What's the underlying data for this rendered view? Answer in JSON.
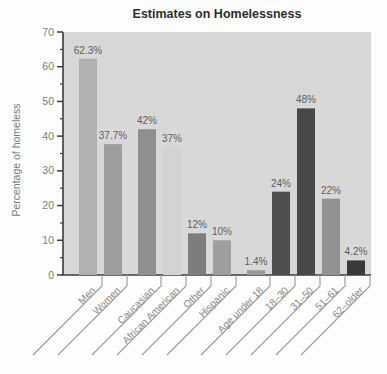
{
  "chart_data": {
    "type": "bar",
    "title": "Estimates on Homelessness",
    "xlabel": "",
    "ylabel": "Percentage of homeless",
    "ylim": [
      0,
      70
    ],
    "yticks": [
      0,
      10,
      20,
      30,
      40,
      50,
      60,
      70
    ],
    "minor_tick_step": 5,
    "grid": false,
    "legend": "none",
    "categories": [
      "Men",
      "Women",
      "Caucasian",
      "African American",
      "Other",
      "Hispanic",
      "Age under 18",
      "18–30",
      "31–50",
      "51–61",
      "62–older"
    ],
    "values": [
      62.3,
      37.7,
      42,
      37,
      12,
      10,
      1.4,
      24,
      48,
      22,
      4.2
    ],
    "value_labels": [
      "62.3%",
      "37.7%",
      "42%",
      "37%",
      "12%",
      "10%",
      "1.4%",
      "24%",
      "48%",
      "22%",
      "4.2%"
    ],
    "group_index": [
      0,
      0,
      1,
      1,
      1,
      1,
      2,
      2,
      2,
      2,
      2
    ],
    "bar_colors": [
      "#b0b0b0",
      "#9e9e9e",
      "#8f8f8f",
      "#d3d3d3",
      "#7d7d7d",
      "#9e9e9e",
      "#9b9b9b",
      "#4f4f4f",
      "#484848",
      "#919191",
      "#3a3a3a"
    ],
    "colors": {
      "plot_bg": "#d8d8d8",
      "page_bg": "#fdfdfd",
      "axis": "#3d3d3d",
      "tick_label": "#7f7f7f",
      "category_label": "#8a8a8a",
      "value_label": "#5f5f5f",
      "leader_line": "#9a9a9a",
      "title": "#2e2e2e",
      "y_axis_title": "#7a7a7a"
    }
  }
}
